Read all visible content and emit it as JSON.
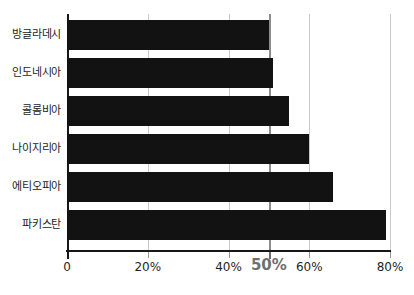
{
  "chart_data": {
    "type": "bar",
    "orientation": "horizontal",
    "title": "",
    "subtitle": "",
    "xlabel": "",
    "ylabel": "",
    "categories": [
      "방글라데시",
      "인도네시아",
      "콜롬비아",
      "나이지리아",
      "에티오피아",
      "파키스탄"
    ],
    "values": [
      50,
      51,
      55,
      60,
      66,
      79
    ],
    "xlim": [
      0,
      80
    ],
    "xticks": [
      0,
      20,
      40,
      50,
      60,
      80
    ],
    "xtick_labels": [
      "0",
      "20%",
      "40%",
      "50%",
      "60%",
      "80%"
    ],
    "grid": true,
    "grid_axis": "x",
    "legend": false,
    "annotations": [
      {
        "name": "fifty-percent-reference-line",
        "value": 50,
        "label": "50%",
        "emphasized": true
      }
    ],
    "colors": {
      "bar": "#121212",
      "background": "#ffffff",
      "gridline": "#c9c9c9",
      "reference_line": "#8d8d8d",
      "axis": "#171717",
      "tick_label": "#1f1f1f",
      "emphasis_label": "#6f6f6f",
      "category_label": "#1c1c1c"
    }
  },
  "geometry": {
    "plot_left_px": 67,
    "plot_right_px": 390,
    "plot_top_px": 14,
    "baseline_px": 250,
    "bar_height_px": 30,
    "bar_gap_px": 8,
    "first_bar_top_px": 20
  }
}
